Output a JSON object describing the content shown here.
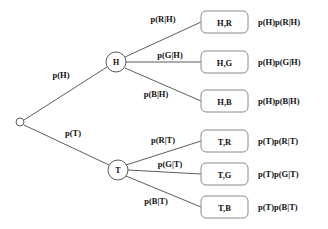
{
  "diagram": {
    "type": "probability-tree",
    "colors": {
      "background": "#ffffff",
      "edge_stroke": "#4a4a4a",
      "node_stroke": "#4a4a4a",
      "box_stroke": "#8a8a8a",
      "text": "#111111"
    },
    "root": {
      "label": "",
      "cx": 20,
      "cy": 122,
      "r": 4
    },
    "stage1": [
      {
        "id": "node-h",
        "label": "H",
        "cx": 116,
        "cy": 62,
        "r": 10,
        "edge_label": "p(H)",
        "edge_label_x": 61,
        "edge_label_y": 75
      },
      {
        "id": "node-t",
        "label": "T",
        "cx": 118,
        "cy": 170,
        "r": 10,
        "edge_label": "p(T)",
        "edge_label_x": 73,
        "edge_label_y": 133
      }
    ],
    "branches": [
      {
        "id": "branch-h-r",
        "parent": "node-h",
        "edge_label": "p(R|H)",
        "edge_label_x": 163,
        "edge_label_y": 19,
        "outcome": "H,R",
        "result": "p(H)p(R|H)",
        "box_x": 201,
        "box_y": 11,
        "box_w": 47,
        "box_h": 22,
        "result_x": 258,
        "result_y": 22
      },
      {
        "id": "branch-h-g",
        "parent": "node-h",
        "edge_label": "p(G|H)",
        "edge_label_x": 170,
        "edge_label_y": 55,
        "outcome": "H,G",
        "result": "p(H)p(G|H)",
        "box_x": 201,
        "box_y": 51,
        "box_w": 47,
        "box_h": 22,
        "result_x": 258,
        "result_y": 62
      },
      {
        "id": "branch-h-b",
        "parent": "node-h",
        "edge_label": "p(B|H)",
        "edge_label_x": 156,
        "edge_label_y": 94,
        "outcome": "H,B",
        "result": "p(H)p(B|H)",
        "box_x": 201,
        "box_y": 90,
        "box_w": 47,
        "box_h": 22,
        "result_x": 258,
        "result_y": 101
      },
      {
        "id": "branch-t-r",
        "parent": "node-t",
        "edge_label": "p(R|T)",
        "edge_label_x": 163,
        "edge_label_y": 140,
        "outcome": "T,R",
        "result": "p(T)p(R|T)",
        "box_x": 201,
        "box_y": 130,
        "box_w": 47,
        "box_h": 22,
        "result_x": 258,
        "result_y": 141
      },
      {
        "id": "branch-t-g",
        "parent": "node-t",
        "edge_label": "p(G|T)",
        "edge_label_x": 170,
        "edge_label_y": 164,
        "outcome": "T,G",
        "result": "p(T)p(G|T)",
        "box_x": 201,
        "box_y": 163,
        "box_w": 47,
        "box_h": 22,
        "result_x": 258,
        "result_y": 174
      },
      {
        "id": "branch-t-b",
        "parent": "node-t",
        "edge_label": "p(B|T)",
        "edge_label_x": 156,
        "edge_label_y": 201,
        "outcome": "T,B",
        "result": "p(T)p(B|T)",
        "box_x": 201,
        "box_y": 196,
        "box_w": 47,
        "box_h": 22,
        "result_x": 258,
        "result_y": 207
      }
    ]
  }
}
